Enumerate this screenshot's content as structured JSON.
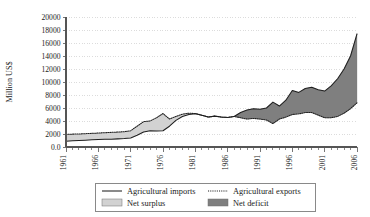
{
  "chart_data": {
    "type": "area",
    "title": "",
    "subtitle": "",
    "xlabel": "",
    "ylabel": "Million US$",
    "ylim": [
      0,
      20000
    ],
    "xlim": [
      1961,
      2006
    ],
    "grid": true,
    "legend_position": "bottom",
    "y_ticks": [
      0,
      2000,
      4000,
      6000,
      8000,
      10000,
      12000,
      14000,
      16000,
      18000,
      20000
    ],
    "y_tick_labels": [
      "0.0",
      "2000",
      "4000",
      "6000",
      "8000",
      "10000",
      "12000",
      "14000",
      "16000",
      "18000",
      "20000"
    ],
    "x_ticks": [
      1961,
      1966,
      1971,
      1976,
      1981,
      1986,
      1991,
      1996,
      2001,
      2006
    ],
    "x_tick_labels": [
      "1961",
      "1966",
      "1971",
      "1976",
      "1981",
      "1986",
      "1991",
      "1996",
      "2001",
      "2006"
    ],
    "x_minor_tick_interval": 1,
    "x": [
      1961,
      1962,
      1963,
      1964,
      1965,
      1966,
      1967,
      1968,
      1969,
      1970,
      1971,
      1972,
      1973,
      1974,
      1975,
      1976,
      1977,
      1978,
      1979,
      1980,
      1981,
      1982,
      1983,
      1984,
      1985,
      1986,
      1987,
      1988,
      1989,
      1990,
      1991,
      1992,
      1993,
      1994,
      1995,
      1996,
      1997,
      1998,
      1999,
      2000,
      2001,
      2002,
      2003,
      2004,
      2005,
      2006
    ],
    "series": [
      {
        "name": "Agricultural imports",
        "style": "solid-line",
        "values": [
          900,
          950,
          1000,
          1050,
          1100,
          1150,
          1180,
          1200,
          1250,
          1300,
          1400,
          1800,
          2300,
          2500,
          2450,
          2500,
          3200,
          4100,
          4700,
          5000,
          5100,
          4900,
          4600,
          4750,
          4600,
          4550,
          4700,
          5300,
          5700,
          5900,
          5800,
          6000,
          6900,
          6300,
          7200,
          8700,
          8400,
          9000,
          9200,
          8800,
          8600,
          9400,
          10500,
          12000,
          14000,
          17400
        ]
      },
      {
        "name": "Agricultural exports",
        "style": "dotted-line",
        "values": [
          1950,
          1980,
          2000,
          2050,
          2100,
          2150,
          2200,
          2250,
          2300,
          2350,
          2500,
          3200,
          3900,
          4000,
          4500,
          5150,
          4300,
          4700,
          5050,
          5200,
          5150,
          4900,
          4600,
          4750,
          4600,
          4550,
          4700,
          4500,
          4300,
          4400,
          4300,
          4150,
          3600,
          4300,
          4600,
          5000,
          5100,
          5300,
          5300,
          4900,
          4500,
          4500,
          4700,
          5200,
          5900,
          6800
        ]
      }
    ],
    "bands": [
      {
        "name": "Net surplus",
        "description": "Area where agricultural exports exceed agricultural imports",
        "color": "#d2d2d2"
      },
      {
        "name": "Net deficit",
        "description": "Area where agricultural imports exceed agricultural exports",
        "color": "#7f7f7f"
      }
    ]
  },
  "legend": {
    "items": [
      {
        "label": "Agricultural imports",
        "marker": "solid-line"
      },
      {
        "label": "Agricultural exports",
        "marker": "dotted-line"
      },
      {
        "label": "Net surplus",
        "marker": "swatch",
        "color": "#d2d2d2"
      },
      {
        "label": "Net deficit",
        "marker": "swatch",
        "color": "#7f7f7f"
      }
    ]
  }
}
